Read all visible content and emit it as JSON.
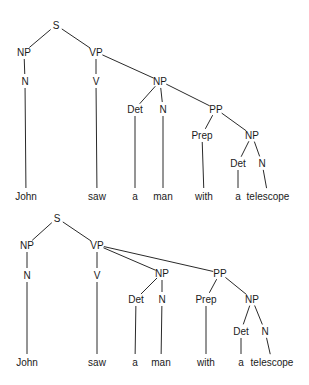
{
  "diagram": {
    "colors": {
      "line": "#2a2a2a",
      "text": "#1a1a1a",
      "background": "#ffffff"
    },
    "trees": [
      {
        "name": "np-attachment",
        "nodes": [
          {
            "id": "S",
            "label": "S",
            "x": 56,
            "y": 25
          },
          {
            "id": "NP1",
            "label": "NP",
            "x": 24,
            "y": 52
          },
          {
            "id": "VP",
            "label": "VP",
            "x": 96,
            "y": 52
          },
          {
            "id": "N1",
            "label": "N",
            "x": 25,
            "y": 81
          },
          {
            "id": "V",
            "label": "V",
            "x": 96,
            "y": 81
          },
          {
            "id": "NP2",
            "label": "NP",
            "x": 160,
            "y": 81
          },
          {
            "id": "Det1",
            "label": "Det",
            "x": 135,
            "y": 109
          },
          {
            "id": "N2",
            "label": "N",
            "x": 163,
            "y": 109
          },
          {
            "id": "PP",
            "label": "PP",
            "x": 216,
            "y": 109
          },
          {
            "id": "Prep",
            "label": "Prep",
            "x": 202,
            "y": 135
          },
          {
            "id": "NP3",
            "label": "NP",
            "x": 252,
            "y": 135
          },
          {
            "id": "Det2",
            "label": "Det",
            "x": 238,
            "y": 163
          },
          {
            "id": "N3",
            "label": "N",
            "x": 262,
            "y": 163
          },
          {
            "id": "w1",
            "label": "John",
            "x": 26,
            "y": 196
          },
          {
            "id": "w2",
            "label": "saw",
            "x": 97,
            "y": 196
          },
          {
            "id": "w3",
            "label": "a",
            "x": 135,
            "y": 196
          },
          {
            "id": "w4",
            "label": "man",
            "x": 163,
            "y": 196
          },
          {
            "id": "w5",
            "label": "with",
            "x": 204,
            "y": 196
          },
          {
            "id": "w6",
            "label": "a",
            "x": 238,
            "y": 196
          },
          {
            "id": "w7",
            "label": "telescope",
            "x": 268,
            "y": 196
          }
        ],
        "edges": [
          [
            "S",
            "NP1"
          ],
          [
            "S",
            "VP"
          ],
          [
            "NP1",
            "N1"
          ],
          [
            "VP",
            "V"
          ],
          [
            "VP",
            "NP2"
          ],
          [
            "NP2",
            "Det1"
          ],
          [
            "NP2",
            "N2"
          ],
          [
            "NP2",
            "PP"
          ],
          [
            "PP",
            "Prep"
          ],
          [
            "PP",
            "NP3"
          ],
          [
            "NP3",
            "Det2"
          ],
          [
            "NP3",
            "N3"
          ],
          [
            "N1",
            "w1"
          ],
          [
            "V",
            "w2"
          ],
          [
            "Det1",
            "w3"
          ],
          [
            "N2",
            "w4"
          ],
          [
            "Prep",
            "w5"
          ],
          [
            "Det2",
            "w6"
          ],
          [
            "N3",
            "w7"
          ]
        ]
      },
      {
        "name": "vp-attachment",
        "nodes": [
          {
            "id": "S",
            "label": "S",
            "x": 57,
            "y": 218
          },
          {
            "id": "NP1",
            "label": "NP",
            "x": 27,
            "y": 245
          },
          {
            "id": "VP",
            "label": "VP",
            "x": 97,
            "y": 245
          },
          {
            "id": "N1",
            "label": "N",
            "x": 27,
            "y": 275
          },
          {
            "id": "V",
            "label": "V",
            "x": 97,
            "y": 275
          },
          {
            "id": "NP2",
            "label": "NP",
            "x": 162,
            "y": 273
          },
          {
            "id": "PP",
            "label": "PP",
            "x": 220,
            "y": 273
          },
          {
            "id": "Det1",
            "label": "Det",
            "x": 136,
            "y": 299
          },
          {
            "id": "N2",
            "label": "N",
            "x": 162,
            "y": 299
          },
          {
            "id": "Prep",
            "label": "Prep",
            "x": 206,
            "y": 299
          },
          {
            "id": "NP3",
            "label": "NP",
            "x": 252,
            "y": 299
          },
          {
            "id": "Det2",
            "label": "Det",
            "x": 241,
            "y": 331
          },
          {
            "id": "N3",
            "label": "N",
            "x": 265,
            "y": 331
          },
          {
            "id": "w1",
            "label": "John",
            "x": 27,
            "y": 362
          },
          {
            "id": "w2",
            "label": "saw",
            "x": 97,
            "y": 362
          },
          {
            "id": "w3",
            "label": "a",
            "x": 135,
            "y": 362
          },
          {
            "id": "w4",
            "label": "man",
            "x": 161,
            "y": 362
          },
          {
            "id": "w5",
            "label": "with",
            "x": 206,
            "y": 362
          },
          {
            "id": "w6",
            "label": "a",
            "x": 241,
            "y": 362
          },
          {
            "id": "w7",
            "label": "telescope",
            "x": 272,
            "y": 362
          }
        ],
        "edges": [
          [
            "S",
            "NP1"
          ],
          [
            "S",
            "VP"
          ],
          [
            "NP1",
            "N1"
          ],
          [
            "VP",
            "V"
          ],
          [
            "VP",
            "NP2"
          ],
          [
            "VP",
            "PP"
          ],
          [
            "NP2",
            "Det1"
          ],
          [
            "NP2",
            "N2"
          ],
          [
            "PP",
            "Prep"
          ],
          [
            "PP",
            "NP3"
          ],
          [
            "NP3",
            "Det2"
          ],
          [
            "NP3",
            "N3"
          ],
          [
            "N1",
            "w1"
          ],
          [
            "V",
            "w2"
          ],
          [
            "Det1",
            "w3"
          ],
          [
            "N2",
            "w4"
          ],
          [
            "Prep",
            "w5"
          ],
          [
            "Det2",
            "w6"
          ],
          [
            "N3",
            "w7"
          ]
        ]
      }
    ]
  }
}
